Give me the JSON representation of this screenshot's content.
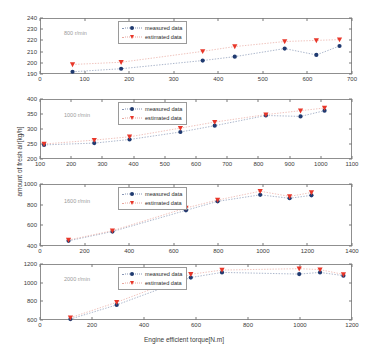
{
  "chart_data": {
    "type": "scatter",
    "title": "",
    "xlabel": "Engine efficient torque[N.m]",
    "ylabel": "amount of fresh air[kg/h]",
    "grid": false,
    "legend_position": "top-center",
    "legend": [
      {
        "name": "measured data",
        "marker": "circle",
        "color": "#1f3a70"
      },
      {
        "name": "estimated data",
        "marker": "triangle-down",
        "color": "#e8372a"
      }
    ],
    "panels": [
      {
        "annotation": "800 r/min",
        "xlim": [
          0,
          700
        ],
        "ylim": [
          190,
          240
        ],
        "xticks": [
          0,
          100,
          200,
          300,
          400,
          500,
          600,
          700
        ],
        "yticks": [
          190,
          200,
          210,
          220,
          230,
          240
        ],
        "x": [
          73,
          182,
          365,
          437,
          549,
          620,
          672
        ],
        "series": [
          {
            "name": "measured data",
            "values": [
              192,
              194.7,
              202,
              205.5,
              212.7,
              207,
              215
            ]
          },
          {
            "name": "estimated data",
            "values": [
              198.5,
              200.5,
              210.2,
              214.5,
              219,
              220,
              220.7
            ]
          }
        ]
      },
      {
        "annotation": "1000 r/min",
        "xlim": [
          100,
          1100
        ],
        "ylim": [
          200,
          400
        ],
        "xticks": [
          100,
          200,
          300,
          400,
          500,
          600,
          700,
          800,
          900,
          1000,
          1100
        ],
        "yticks": [
          200,
          250,
          300,
          350,
          400
        ],
        "x": [
          113,
          274,
          387,
          550,
          660,
          824,
          935,
          1012
        ],
        "series": [
          {
            "name": "measured data",
            "values": [
              247,
              253,
              265,
              290,
              311,
              345,
              342,
              361
            ]
          },
          {
            "name": "estimated data",
            "values": [
              250,
              263,
              274,
              303,
              323,
              348,
              361,
              370
            ]
          }
        ]
      },
      {
        "annotation": "1600 r/min",
        "xlim": [
          0,
          1400
        ],
        "ylim": [
          400,
          1000
        ],
        "xticks": [
          0,
          200,
          400,
          600,
          800,
          1000,
          1200,
          1400
        ],
        "yticks": [
          400,
          600,
          800,
          1000
        ],
        "x": [
          128,
          325,
          655,
          797,
          988,
          1120,
          1218
        ],
        "series": [
          {
            "name": "measured data",
            "values": [
              450,
              540,
              745,
              832,
              895,
              862,
              890
            ]
          },
          {
            "name": "estimated data",
            "values": [
              458,
              548,
              768,
              845,
              930,
              880,
              918
            ]
          }
        ]
      },
      {
        "annotation": "2000 r/min",
        "xlim": [
          0,
          1200
        ],
        "ylim": [
          600,
          1200
        ],
        "xticks": [
          0,
          200,
          400,
          600,
          800,
          1000,
          1200
        ],
        "yticks": [
          600,
          800,
          1000,
          1200
        ],
        "x": [
          117,
          295,
          580,
          700,
          997,
          1077,
          1167
        ],
        "series": [
          {
            "name": "measured data",
            "values": [
              610,
              762,
              1055,
              1110,
              1092,
              1110,
              1075
            ]
          },
          {
            "name": "estimated data",
            "values": [
              625,
              790,
              1090,
              1135,
              1150,
              1140,
              1088
            ]
          }
        ]
      }
    ]
  }
}
